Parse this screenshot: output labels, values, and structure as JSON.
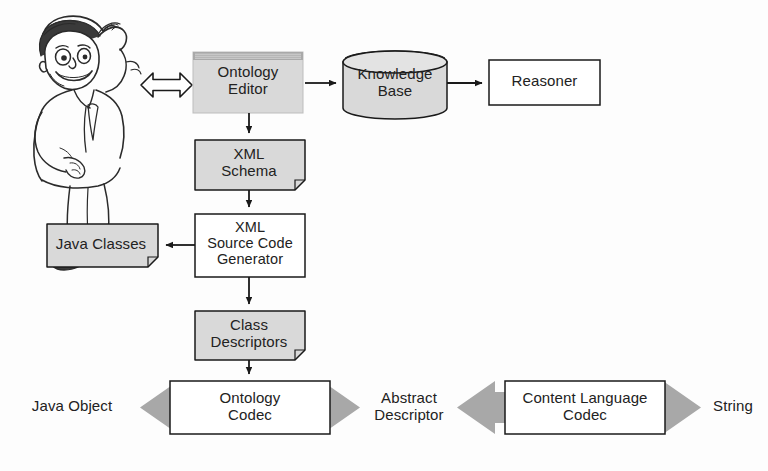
{
  "diagram": {
    "palette": {
      "shape_fill_gray": "#d9d9d9",
      "shape_fill_white": "#ffffff",
      "stroke": "#1a1a1a",
      "arrow_block_fill": "#a8a8a8",
      "titlebar_fill": "#a9a9a9",
      "background": "#fdfdfd"
    },
    "actor": {
      "name": "developer-character",
      "description": "cartoon man in lab coat scratching head"
    },
    "nodes": [
      {
        "id": "ontology-editor",
        "label": "Ontology\nEditor",
        "shape": "window",
        "fill": "#d9d9d9",
        "has_titlebar": true
      },
      {
        "id": "knowledge-base",
        "label": "Knowledge\nBase",
        "shape": "cylinder",
        "fill": "#d9d9d9"
      },
      {
        "id": "reasoner",
        "label": "Reasoner",
        "shape": "rect",
        "fill": "#ffffff"
      },
      {
        "id": "xml-schema",
        "label": "XML\nSchema",
        "shape": "document",
        "fill": "#d9d9d9"
      },
      {
        "id": "xml-source-code-generator",
        "label": "XML\nSource Code\nGenerator",
        "shape": "rect",
        "fill": "#ffffff"
      },
      {
        "id": "java-classes",
        "label": "Java Classes",
        "shape": "document",
        "fill": "#d9d9d9"
      },
      {
        "id": "class-descriptors",
        "label": "Class\nDescriptors",
        "shape": "document",
        "fill": "#d9d9d9"
      },
      {
        "id": "ontology-codec",
        "label": "Ontology\nCodec",
        "shape": "rect",
        "fill": "#ffffff"
      },
      {
        "id": "content-language-codec",
        "label": "Content Language\nCodec",
        "shape": "rect",
        "fill": "#ffffff"
      }
    ],
    "endpoint_labels": [
      {
        "id": "java-object",
        "label": "Java Object"
      },
      {
        "id": "abstract-descriptor",
        "label": "Abstract\nDescriptor"
      },
      {
        "id": "string",
        "label": "String"
      }
    ],
    "connectors": [
      {
        "id": "actor-to-editor",
        "type": "double-arrow-hollow",
        "from": "developer-character",
        "to": "ontology-editor"
      },
      {
        "id": "editor-to-kb",
        "type": "arrow",
        "from": "ontology-editor",
        "to": "knowledge-base"
      },
      {
        "id": "kb-to-reasoner",
        "type": "arrow",
        "from": "knowledge-base",
        "to": "reasoner"
      },
      {
        "id": "editor-to-schema",
        "type": "arrow",
        "from": "ontology-editor",
        "to": "xml-schema"
      },
      {
        "id": "schema-to-generator",
        "type": "arrow",
        "from": "xml-schema",
        "to": "xml-source-code-generator"
      },
      {
        "id": "generator-to-java-classes",
        "type": "arrow",
        "from": "xml-source-code-generator",
        "to": "java-classes"
      },
      {
        "id": "generator-to-class-descriptors",
        "type": "arrow",
        "from": "xml-source-code-generator",
        "to": "class-descriptors"
      },
      {
        "id": "class-descriptors-to-codec",
        "type": "arrow",
        "from": "class-descriptors",
        "to": "ontology-codec"
      },
      {
        "id": "java-object-to-ontology-codec",
        "type": "block-arrow-left",
        "from": "ontology-codec",
        "to": "java-object"
      },
      {
        "id": "ontology-codec-to-abstract-descriptor",
        "type": "block-arrow-right",
        "from": "ontology-codec",
        "to": "abstract-descriptor"
      },
      {
        "id": "abstract-descriptor-to-content-codec",
        "type": "block-arrow-left",
        "from": "content-language-codec",
        "to": "abstract-descriptor"
      },
      {
        "id": "content-codec-to-string",
        "type": "block-arrow-right",
        "from": "content-language-codec",
        "to": "string"
      }
    ]
  }
}
